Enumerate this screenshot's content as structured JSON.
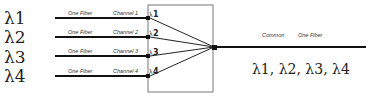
{
  "inputs": [
    {
      "wavelength": "λ1",
      "fiber_label": "One Fiber",
      "channel_label": "Channel 1",
      "port_label": "1"
    },
    {
      "wavelength": "λ2",
      "fiber_label": "One Fiber",
      "channel_label": "Channel 2",
      "port_label": "2"
    },
    {
      "wavelength": "λ3",
      "fiber_label": "One Fiber",
      "channel_label": "Channel 3",
      "port_label": "3"
    },
    {
      "wavelength": "λ4",
      "fiber_label": "One Fiber",
      "channel_label": "Channel 4",
      "port_label": "4"
    }
  ],
  "output": {
    "common_label": "Common",
    "fiber_label": "One Fiber",
    "combined_wavelengths": "λ1, λ2, λ3, λ4"
  },
  "colors": {
    "line": "#111111",
    "box": "#666666"
  }
}
